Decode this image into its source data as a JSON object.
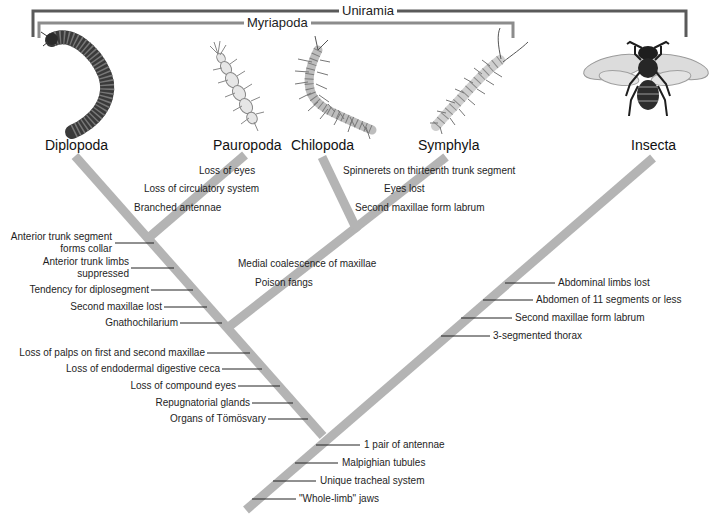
{
  "groups": {
    "outer": "Uniramia",
    "inner": "Myriapoda"
  },
  "taxa": [
    {
      "name": "Diplopoda",
      "organism": "millipede"
    },
    {
      "name": "Pauropoda",
      "organism": "pauropod"
    },
    {
      "name": "Chilopoda",
      "organism": "centipede"
    },
    {
      "name": "Symphyla",
      "organism": "symphylan"
    },
    {
      "name": "Insecta",
      "organism": "bee"
    }
  ],
  "characters": {
    "pauropoda_branch": [
      "Loss of eyes",
      "Loss of circulatory system",
      "Branched antennae"
    ],
    "symphyla_branch": [
      "Spinnerets on thirteenth trunk segment",
      "Eyes lost",
      "Second maxillae form labrum"
    ],
    "chilopoda_symphyla_stem": [
      "Medial coalescence of maxillae",
      "Poison fangs"
    ],
    "diplopoda_stem": [
      "Anterior trunk segment\nforms collar",
      "Anterior trunk limbs\nsuppressed",
      "Tendency for diplosegment",
      "Second maxillae lost",
      "Gnathochilarium"
    ],
    "myriapoda_stem": [
      "Loss of palps on first and second maxillae",
      "Loss of endodermal digestive ceca",
      "Loss of compound eyes",
      "Repugnatorial glands",
      "Organs of Tömösvary"
    ],
    "insecta_branch": [
      "Abdominal limbs lost",
      "Abdomen of 11 segments or less",
      "Second maxillae form labrum",
      "3-segmented thorax"
    ],
    "uniramia_stem": [
      "1 pair of antennae",
      "Malpighian tubules",
      "Unique tracheal system",
      "\"Whole-limb\" jaws"
    ]
  },
  "colors": {
    "branch": "#b4b4b4",
    "bracket_outer": "#5a5a5a",
    "bracket_inner": "#8c8c8c",
    "text": "#1e1e1e"
  }
}
